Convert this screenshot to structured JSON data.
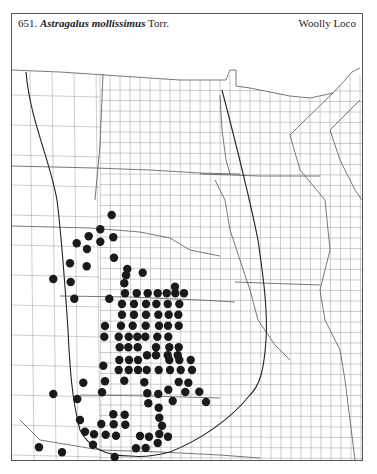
{
  "header": {
    "number": "651.",
    "scientific_name": "Astragalus mollissimus",
    "authority": "Torr.",
    "common_name": "Woolly Loco"
  },
  "map": {
    "region": "Great Plains & Upper Midwest (county outline map)",
    "dot_color": "#1a1a1a",
    "line_color": "#444444",
    "occurrence_records": [
      [
        111.7,
        215
      ],
      [
        100.3,
        229.3
      ],
      [
        88.7,
        236.3
      ],
      [
        113.3,
        237.3
      ],
      [
        100.3,
        241.7
      ],
      [
        76.7,
        243.3
      ],
      [
        87,
        249
      ],
      [
        114,
        257.7
      ],
      [
        70,
        263.3
      ],
      [
        86.7,
        266.3
      ],
      [
        127.3,
        269
      ],
      [
        126,
        275.3
      ],
      [
        124.3,
        283.3
      ],
      [
        142.7,
        272.7
      ],
      [
        53.3,
        279
      ],
      [
        70.7,
        282
      ],
      [
        74.3,
        298.7
      ],
      [
        109.3,
        298.7
      ],
      [
        175,
        286.7
      ],
      [
        125,
        293.3
      ],
      [
        136.7,
        293.3
      ],
      [
        147.7,
        293.3
      ],
      [
        157.7,
        293.3
      ],
      [
        166.7,
        293.3
      ],
      [
        175.3,
        293.3
      ],
      [
        184,
        293.3
      ],
      [
        122,
        304
      ],
      [
        134,
        304
      ],
      [
        146,
        304
      ],
      [
        156.3,
        304
      ],
      [
        167.7,
        304
      ],
      [
        179.3,
        304
      ],
      [
        122,
        314.7
      ],
      [
        134,
        314.7
      ],
      [
        146,
        314.7
      ],
      [
        158.3,
        314.7
      ],
      [
        168.7,
        314.7
      ],
      [
        178.3,
        314.7
      ],
      [
        105,
        326
      ],
      [
        121,
        325.7
      ],
      [
        132.7,
        325.7
      ],
      [
        145.7,
        325.7
      ],
      [
        159,
        325.7
      ],
      [
        168,
        325.7
      ],
      [
        178.7,
        325.7
      ],
      [
        104.3,
        336.7
      ],
      [
        118.7,
        336.7
      ],
      [
        128.7,
        336.7
      ],
      [
        137.3,
        336.7
      ],
      [
        145.3,
        336.7
      ],
      [
        157.3,
        336.7
      ],
      [
        168.3,
        336.7
      ],
      [
        119.7,
        347.3
      ],
      [
        128.3,
        347.3
      ],
      [
        137.7,
        347.3
      ],
      [
        156,
        347.3
      ],
      [
        169.3,
        347.3
      ],
      [
        178.7,
        347.3
      ],
      [
        147,
        355.3
      ],
      [
        156,
        355.3
      ],
      [
        167.7,
        355.3
      ],
      [
        177.7,
        355.3
      ],
      [
        119.3,
        360
      ],
      [
        129,
        360
      ],
      [
        138,
        360
      ],
      [
        169.3,
        360
      ],
      [
        179.3,
        360
      ],
      [
        190.7,
        360
      ],
      [
        103.3,
        365.7
      ],
      [
        118.7,
        370
      ],
      [
        128.7,
        370
      ],
      [
        138,
        370
      ],
      [
        146.7,
        370
      ],
      [
        158.7,
        370
      ],
      [
        170,
        370
      ],
      [
        180.7,
        370
      ],
      [
        192,
        370
      ],
      [
        83.3,
        382.7
      ],
      [
        105,
        381.3
      ],
      [
        124.3,
        380.7
      ],
      [
        144.3,
        382.3
      ],
      [
        178.7,
        382
      ],
      [
        188.3,
        382.7
      ],
      [
        53.3,
        394
      ],
      [
        102,
        392.3
      ],
      [
        147.3,
        393.3
      ],
      [
        158.3,
        394
      ],
      [
        168.3,
        389.7
      ],
      [
        185.3,
        392
      ],
      [
        199.3,
        391.7
      ],
      [
        77.3,
        399
      ],
      [
        172.7,
        401
      ],
      [
        148.3,
        403.3
      ],
      [
        206,
        402
      ],
      [
        158.7,
        407.7
      ],
      [
        113.3,
        414.3
      ],
      [
        124.7,
        414.7
      ],
      [
        159.3,
        417.7
      ],
      [
        80,
        420
      ],
      [
        101.3,
        424
      ],
      [
        113.7,
        424.3
      ],
      [
        125.3,
        424.7
      ],
      [
        162,
        425.7
      ],
      [
        85,
        431.7
      ],
      [
        94,
        434.3
      ],
      [
        105.7,
        434.7
      ],
      [
        116,
        435.7
      ],
      [
        140,
        436
      ],
      [
        149,
        436.7
      ],
      [
        159.3,
        434
      ],
      [
        168,
        436.7
      ],
      [
        93,
        444.7
      ],
      [
        157.7,
        443
      ],
      [
        136,
        448.3
      ],
      [
        145.7,
        448
      ],
      [
        39,
        447.3
      ],
      [
        62,
        452.3
      ],
      [
        114.7,
        457
      ]
    ]
  }
}
